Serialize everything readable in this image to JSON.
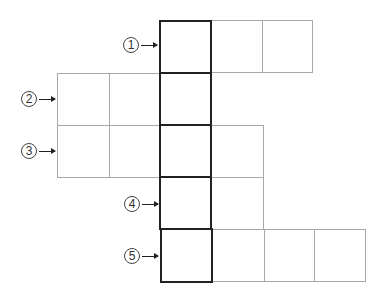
{
  "diagram": {
    "type": "crossword-grid",
    "cell_size_px": 52,
    "colors": {
      "thin_border": "#a8a8a8",
      "key_column_border": "#222222",
      "label": "#333333",
      "background": "#ffffff"
    },
    "key_column_index": 2,
    "rows": [
      {
        "number": "1",
        "label": "①",
        "cells": 3,
        "start_col": 2
      },
      {
        "number": "2",
        "label": "②",
        "cells": 3,
        "start_col": 0
      },
      {
        "number": "3",
        "label": "③",
        "cells": 4,
        "start_col": 0
      },
      {
        "number": "4",
        "label": "④",
        "cells": 2,
        "start_col": 2
      },
      {
        "number": "5",
        "label": "⑤",
        "cells": 4,
        "start_col": 2
      }
    ]
  },
  "labels": {
    "r1": "1",
    "r2": "2",
    "r3": "3",
    "r4": "4",
    "r5": "5"
  }
}
